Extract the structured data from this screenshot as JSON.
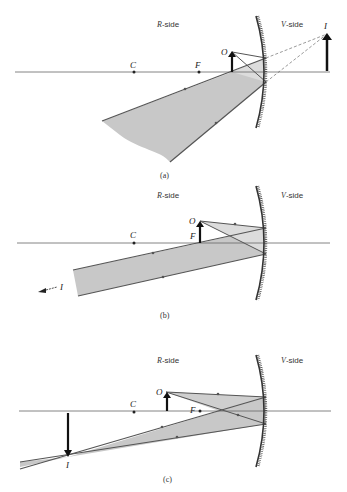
{
  "figure": {
    "panels": [
      {
        "id": "a",
        "caption": "(a)",
        "r_side_label": "R-side",
        "v_side_label": "V-side",
        "points": {
          "C": "C",
          "F": "F",
          "O": "O",
          "I": "I"
        },
        "description": "Object between F and mirror; virtual, upright, enlarged image on V-side"
      },
      {
        "id": "b",
        "caption": "(b)",
        "r_side_label": "R-side",
        "v_side_label": "V-side",
        "points": {
          "C": "C",
          "F": "F",
          "O": "O",
          "I": "I"
        },
        "image_note": "← I",
        "description": "Object at F; reflected rays parallel, image at infinity"
      },
      {
        "id": "c",
        "caption": "(c)",
        "r_side_label": "R-side",
        "v_side_label": "V-side",
        "points": {
          "C": "C",
          "F": "F",
          "O": "O",
          "I": "I"
        },
        "description": "Object between C and F; real, inverted, enlarged image beyond C"
      }
    ],
    "colors": {
      "ray": "#555555",
      "beam_fill": "#c8c8c8",
      "beam_fill_light": "#dddddd",
      "axis": "#666666",
      "arrow": "#111111",
      "mirror": "#333333"
    }
  }
}
